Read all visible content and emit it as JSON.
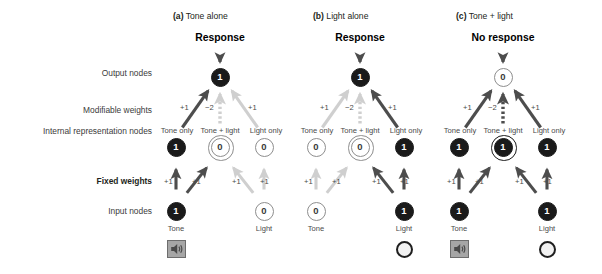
{
  "figure": {
    "row_labels": [
      {
        "id": "output-nodes",
        "text": "Output nodes",
        "bold": false
      },
      {
        "id": "modifiable-weights",
        "text": "Modifiable weights",
        "bold": false
      },
      {
        "id": "internal-representation-nodes",
        "text": "Internal representation nodes",
        "bold": false
      },
      {
        "id": "fixed-weights",
        "text": "Fixed weights",
        "bold": true
      },
      {
        "id": "input-nodes",
        "text": "Input nodes",
        "bold": false
      }
    ],
    "node_labels": {
      "internal": [
        "Tone only",
        "Tone + light",
        "Light only"
      ],
      "input": [
        "Tone",
        "Light"
      ]
    },
    "weights": {
      "fixed": "+1",
      "modifiable_positive": "+1",
      "modifiable_negative": "−2"
    },
    "icons": {
      "tone": "speaker-icon",
      "light": "lamp-icon"
    },
    "colors": {
      "active": "#4d4d4d",
      "inactive": "#cfcfcf",
      "node_on": "#1a1a1a",
      "node_off_border": "#8e8e8e",
      "speaker_fill": "#a6a6a6",
      "text": "#231f20"
    }
  },
  "panels": [
    {
      "key": "a",
      "letter": "(a)",
      "title": "Tone alone",
      "response": "Response",
      "output_value": "1",
      "output_on": true,
      "internal_values": [
        "1",
        "0",
        "0"
      ],
      "internal_on": [
        true,
        false,
        false
      ],
      "input_values": [
        "1",
        "0"
      ],
      "input_on": [
        true,
        false
      ],
      "show_tone_icon": true,
      "show_light_icon": false,
      "fixed_active": [
        true,
        true,
        false,
        false
      ],
      "modifiable_active": [
        true,
        false,
        false
      ]
    },
    {
      "key": "b",
      "letter": "(b)",
      "title": "Light alone",
      "response": "Response",
      "output_value": "1",
      "output_on": true,
      "internal_values": [
        "0",
        "0",
        "1"
      ],
      "internal_on": [
        false,
        false,
        true
      ],
      "input_values": [
        "0",
        "1"
      ],
      "input_on": [
        false,
        true
      ],
      "show_tone_icon": false,
      "show_light_icon": true,
      "fixed_active": [
        false,
        false,
        true,
        true
      ],
      "modifiable_active": [
        false,
        false,
        true
      ]
    },
    {
      "key": "c",
      "letter": "(c)",
      "title": "Tone + light",
      "response": "No response",
      "output_value": "0",
      "output_on": false,
      "internal_values": [
        "1",
        "1",
        "1"
      ],
      "internal_on": [
        true,
        true,
        true
      ],
      "input_values": [
        "1",
        "1"
      ],
      "input_on": [
        true,
        true
      ],
      "show_tone_icon": true,
      "show_light_icon": true,
      "fixed_active": [
        true,
        true,
        true,
        true
      ],
      "modifiable_active": [
        true,
        true,
        true
      ]
    }
  ]
}
